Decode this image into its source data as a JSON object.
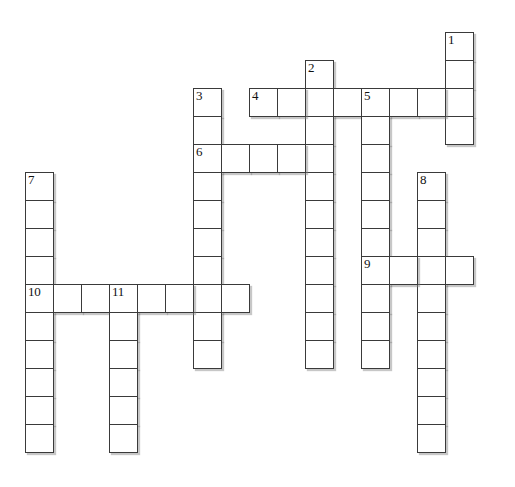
{
  "puzzle": {
    "title": "Crossword Puzzle Grid",
    "cell_size": 28,
    "origin_x": 25,
    "origin_y": 32,
    "grid_cols": 18,
    "grid_rows": 16,
    "border_color": "#3a3a3a",
    "cell_fill": "#ffffff",
    "background": "#ffffff",
    "shadow_color": "#828282",
    "clue_numbers": [
      "1",
      "2",
      "3",
      "4",
      "5",
      "6",
      "7",
      "8",
      "9",
      "10",
      "11"
    ],
    "entries": [
      {
        "number": "1",
        "direction": "down",
        "col": 15,
        "row": 0,
        "length": 4
      },
      {
        "number": "2",
        "direction": "down",
        "col": 10,
        "row": 1,
        "length": 11
      },
      {
        "number": "3",
        "direction": "down",
        "col": 6,
        "row": 2,
        "length": 10
      },
      {
        "number": "4",
        "direction": "across",
        "col": 8,
        "row": 2,
        "length": 7
      },
      {
        "number": "5",
        "direction": "down",
        "col": 12,
        "row": 2,
        "length": 10
      },
      {
        "number": "6",
        "direction": "across",
        "col": 6,
        "row": 4,
        "length": 4
      },
      {
        "number": "7",
        "direction": "down",
        "col": 0,
        "row": 5,
        "length": 9
      },
      {
        "number": "8",
        "direction": "down",
        "col": 14,
        "row": 5,
        "length": 9
      },
      {
        "number": "9",
        "direction": "across",
        "col": 12,
        "row": 8,
        "length": 4
      },
      {
        "number": "10",
        "direction": "across",
        "col": 0,
        "row": 9,
        "length": 8
      },
      {
        "number": "11",
        "direction": "down",
        "col": 3,
        "row": 9,
        "length": 6
      }
    ],
    "cells": [
      {
        "col": 15,
        "row": 0,
        "num": "1",
        "letter": ""
      },
      {
        "col": 15,
        "row": 1,
        "num": "",
        "letter": ""
      },
      {
        "col": 15,
        "row": 2,
        "num": "",
        "letter": ""
      },
      {
        "col": 15,
        "row": 3,
        "num": "",
        "letter": ""
      },
      {
        "col": 10,
        "row": 1,
        "num": "2",
        "letter": ""
      },
      {
        "col": 10,
        "row": 2,
        "num": "",
        "letter": ""
      },
      {
        "col": 10,
        "row": 3,
        "num": "",
        "letter": ""
      },
      {
        "col": 10,
        "row": 4,
        "num": "",
        "letter": ""
      },
      {
        "col": 10,
        "row": 5,
        "num": "",
        "letter": ""
      },
      {
        "col": 10,
        "row": 6,
        "num": "",
        "letter": ""
      },
      {
        "col": 10,
        "row": 7,
        "num": "",
        "letter": ""
      },
      {
        "col": 10,
        "row": 8,
        "num": "",
        "letter": ""
      },
      {
        "col": 10,
        "row": 9,
        "num": "",
        "letter": ""
      },
      {
        "col": 10,
        "row": 10,
        "num": "",
        "letter": ""
      },
      {
        "col": 10,
        "row": 11,
        "num": "",
        "letter": ""
      },
      {
        "col": 6,
        "row": 2,
        "num": "3",
        "letter": ""
      },
      {
        "col": 6,
        "row": 3,
        "num": "",
        "letter": ""
      },
      {
        "col": 6,
        "row": 4,
        "num": "6",
        "letter": ""
      },
      {
        "col": 6,
        "row": 5,
        "num": "",
        "letter": ""
      },
      {
        "col": 6,
        "row": 6,
        "num": "",
        "letter": ""
      },
      {
        "col": 6,
        "row": 7,
        "num": "",
        "letter": ""
      },
      {
        "col": 6,
        "row": 8,
        "num": "",
        "letter": ""
      },
      {
        "col": 6,
        "row": 9,
        "num": "",
        "letter": ""
      },
      {
        "col": 6,
        "row": 10,
        "num": "",
        "letter": ""
      },
      {
        "col": 6,
        "row": 11,
        "num": "",
        "letter": ""
      },
      {
        "col": 8,
        "row": 2,
        "num": "4",
        "letter": ""
      },
      {
        "col": 9,
        "row": 2,
        "num": "",
        "letter": ""
      },
      {
        "col": 11,
        "row": 2,
        "num": "",
        "letter": ""
      },
      {
        "col": 12,
        "row": 2,
        "num": "5",
        "letter": ""
      },
      {
        "col": 13,
        "row": 2,
        "num": "",
        "letter": ""
      },
      {
        "col": 14,
        "row": 2,
        "num": "",
        "letter": ""
      },
      {
        "col": 12,
        "row": 3,
        "num": "",
        "letter": ""
      },
      {
        "col": 12,
        "row": 4,
        "num": "",
        "letter": ""
      },
      {
        "col": 12,
        "row": 5,
        "num": "",
        "letter": ""
      },
      {
        "col": 12,
        "row": 6,
        "num": "",
        "letter": ""
      },
      {
        "col": 12,
        "row": 7,
        "num": "",
        "letter": ""
      },
      {
        "col": 12,
        "row": 8,
        "num": "9",
        "letter": ""
      },
      {
        "col": 12,
        "row": 9,
        "num": "",
        "letter": ""
      },
      {
        "col": 12,
        "row": 10,
        "num": "",
        "letter": ""
      },
      {
        "col": 12,
        "row": 11,
        "num": "",
        "letter": ""
      },
      {
        "col": 7,
        "row": 4,
        "num": "",
        "letter": ""
      },
      {
        "col": 8,
        "row": 4,
        "num": "",
        "letter": ""
      },
      {
        "col": 9,
        "row": 4,
        "num": "",
        "letter": ""
      },
      {
        "col": 0,
        "row": 5,
        "num": "7",
        "letter": ""
      },
      {
        "col": 0,
        "row": 6,
        "num": "",
        "letter": ""
      },
      {
        "col": 0,
        "row": 7,
        "num": "",
        "letter": ""
      },
      {
        "col": 0,
        "row": 8,
        "num": "",
        "letter": ""
      },
      {
        "col": 0,
        "row": 9,
        "num": "10",
        "letter": ""
      },
      {
        "col": 0,
        "row": 10,
        "num": "",
        "letter": ""
      },
      {
        "col": 0,
        "row": 11,
        "num": "",
        "letter": ""
      },
      {
        "col": 0,
        "row": 12,
        "num": "",
        "letter": ""
      },
      {
        "col": 0,
        "row": 13,
        "num": "",
        "letter": ""
      },
      {
        "col": 0,
        "row": 14,
        "num": "",
        "letter": ""
      },
      {
        "col": 14,
        "row": 5,
        "num": "8",
        "letter": ""
      },
      {
        "col": 14,
        "row": 6,
        "num": "",
        "letter": ""
      },
      {
        "col": 14,
        "row": 7,
        "num": "",
        "letter": ""
      },
      {
        "col": 14,
        "row": 8,
        "num": "",
        "letter": ""
      },
      {
        "col": 14,
        "row": 9,
        "num": "",
        "letter": ""
      },
      {
        "col": 14,
        "row": 10,
        "num": "",
        "letter": ""
      },
      {
        "col": 14,
        "row": 11,
        "num": "",
        "letter": ""
      },
      {
        "col": 14,
        "row": 12,
        "num": "",
        "letter": ""
      },
      {
        "col": 14,
        "row": 13,
        "num": "",
        "letter": ""
      },
      {
        "col": 14,
        "row": 14,
        "num": "",
        "letter": ""
      },
      {
        "col": 13,
        "row": 8,
        "num": "",
        "letter": ""
      },
      {
        "col": 15,
        "row": 8,
        "num": "",
        "letter": ""
      },
      {
        "col": 1,
        "row": 9,
        "num": "",
        "letter": ""
      },
      {
        "col": 2,
        "row": 9,
        "num": "",
        "letter": ""
      },
      {
        "col": 3,
        "row": 9,
        "num": "11",
        "letter": ""
      },
      {
        "col": 4,
        "row": 9,
        "num": "",
        "letter": ""
      },
      {
        "col": 5,
        "row": 9,
        "num": "",
        "letter": ""
      },
      {
        "col": 7,
        "row": 9,
        "num": "",
        "letter": ""
      },
      {
        "col": 3,
        "row": 10,
        "num": "",
        "letter": ""
      },
      {
        "col": 3,
        "row": 11,
        "num": "",
        "letter": ""
      },
      {
        "col": 3,
        "row": 12,
        "num": "",
        "letter": ""
      },
      {
        "col": 3,
        "row": 13,
        "num": "",
        "letter": ""
      },
      {
        "col": 3,
        "row": 14,
        "num": "",
        "letter": ""
      }
    ]
  }
}
